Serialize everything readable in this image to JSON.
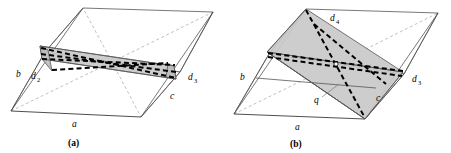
{
  "figure": {
    "background_color": "#ffffff",
    "line_color": "#555555",
    "hidden_line_color": "#b0b0b0",
    "shade_color": "#c9c9c9",
    "diagonal_color": "#000000",
    "width": 451,
    "height": 153
  },
  "panels": [
    {
      "id": "a",
      "caption": "(a)",
      "labels": {
        "edge_b": "b",
        "edge_a": "a",
        "edge_c": "c",
        "diagonal_d2_base": "d",
        "diagonal_d2_sub": "2",
        "diagonal_d3_base": "d",
        "diagonal_d3_sub": "3"
      }
    },
    {
      "id": "b",
      "caption": "(b)",
      "labels": {
        "edge_b": "b",
        "edge_a": "a",
        "edge_c": "c",
        "point_q": "q",
        "diagonal_d4_base": "d",
        "diagonal_d4_sub": "4",
        "diagonal_d3_base": "d",
        "diagonal_d3_sub": "3"
      }
    }
  ]
}
